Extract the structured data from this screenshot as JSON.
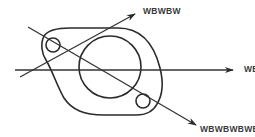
{
  "diagram": {
    "colors": {
      "stroke": "#2a2a2a",
      "label": "#3a3a3a",
      "background": "#ffffff"
    },
    "shapes": {
      "flange_outline": "two-lobed gasket/flange outline",
      "center_hole": {
        "cx": 110,
        "cy": 67,
        "r": 31
      },
      "bolt_hole_upper_left": {
        "cx": 53,
        "cy": 45,
        "r": 7
      },
      "bolt_hole_lower_right": {
        "cx": 143,
        "cy": 101,
        "r": 7
      }
    },
    "arrows": [
      {
        "id": "upper",
        "label": "WBWBW",
        "direction": "up-right"
      },
      {
        "id": "horizontal",
        "label": "WBWBW",
        "direction": "right"
      },
      {
        "id": "lower",
        "label": "WBWBWBWBW",
        "direction": "down-right"
      }
    ]
  }
}
